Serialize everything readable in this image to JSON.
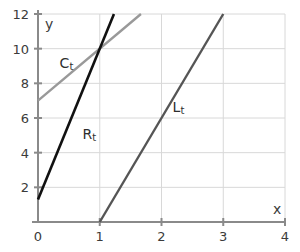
{
  "chart_data": {
    "type": "line",
    "title": "",
    "xlabel": "x",
    "ylabel": "y",
    "xlim": [
      0,
      4
    ],
    "ylim": [
      0,
      12
    ],
    "grid": true,
    "legend": "inline-labels",
    "x_ticks": [
      "0",
      "1",
      "2",
      "3",
      "4"
    ],
    "x_tick_values": [
      0,
      1,
      2,
      3,
      4
    ],
    "y_ticks": [
      "2",
      "4",
      "6",
      "8",
      "10",
      "12"
    ],
    "y_tick_values": [
      2,
      4,
      6,
      8,
      10,
      12
    ],
    "series": [
      {
        "name": "C_t",
        "label": "C",
        "subscript": "t",
        "color": "#999999",
        "width": 2.4,
        "intercept": 7,
        "slope": 3,
        "x": [
          0,
          1.667
        ],
        "values": [
          7,
          12
        ],
        "label_x": 0.35,
        "label_y": 9.1
      },
      {
        "name": "R_t",
        "label": "R",
        "subscript": "t",
        "color": "#111111",
        "width": 2.6,
        "intercept": 1.3,
        "slope": 8.7,
        "x": [
          0,
          1.23
        ],
        "values": [
          1.3,
          12
        ],
        "label_x": 0.72,
        "label_y": 5.0
      },
      {
        "name": "L_t",
        "label": "L",
        "subscript": "t",
        "color": "#555555",
        "width": 2.4,
        "intercept": -6,
        "slope": 6,
        "x": [
          1,
          3
        ],
        "values": [
          0,
          12
        ],
        "label_x": 2.18,
        "label_y": 6.6
      }
    ],
    "colors": {
      "background": "#ffffff",
      "grid": "#d8d8d8",
      "axis": "#8a8a8a",
      "text": "#3b3b3b"
    }
  }
}
